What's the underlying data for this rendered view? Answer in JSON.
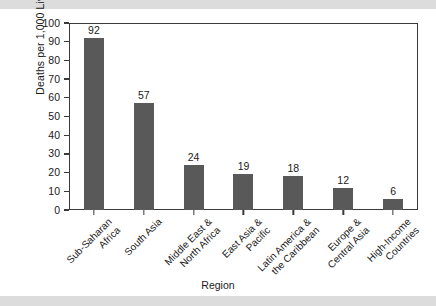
{
  "chart_data": {
    "type": "bar",
    "title": "",
    "xlabel": "Region",
    "ylabel": "Deaths per 1,000 Live Births",
    "ylim": [
      0,
      100
    ],
    "ytick_step": 10,
    "yticks": [
      100,
      90,
      80,
      70,
      60,
      50,
      40,
      30,
      20,
      10,
      0
    ],
    "grid": false,
    "legend": "none",
    "bar_color": "#595959",
    "categories": [
      "Sub-Saharan Africa",
      "South Asia",
      "Middle East & North Africa",
      "East Asia & Pacific",
      "Latin America & the Caribbean",
      "Europe & Central Asia",
      "High-Income Countries"
    ],
    "category_lines": [
      [
        "Sub-Saharan",
        "Africa"
      ],
      [
        "South Asia"
      ],
      [
        "Middle East &",
        "North Africa"
      ],
      [
        "East Asia &",
        "Pacific"
      ],
      [
        "Latin America &",
        "the Caribbean"
      ],
      [
        "Europe &",
        "Central Asia"
      ],
      [
        "High-Income",
        "Countries"
      ]
    ],
    "values": [
      92,
      57,
      24,
      19,
      18,
      12,
      6
    ],
    "value_labels": [
      "92",
      "57",
      "24",
      "19",
      "18",
      "12",
      "6"
    ]
  },
  "figure": {
    "band_color": "#dcdcdc",
    "background": "#ffffff",
    "axis_color": "#3a3a3a"
  }
}
